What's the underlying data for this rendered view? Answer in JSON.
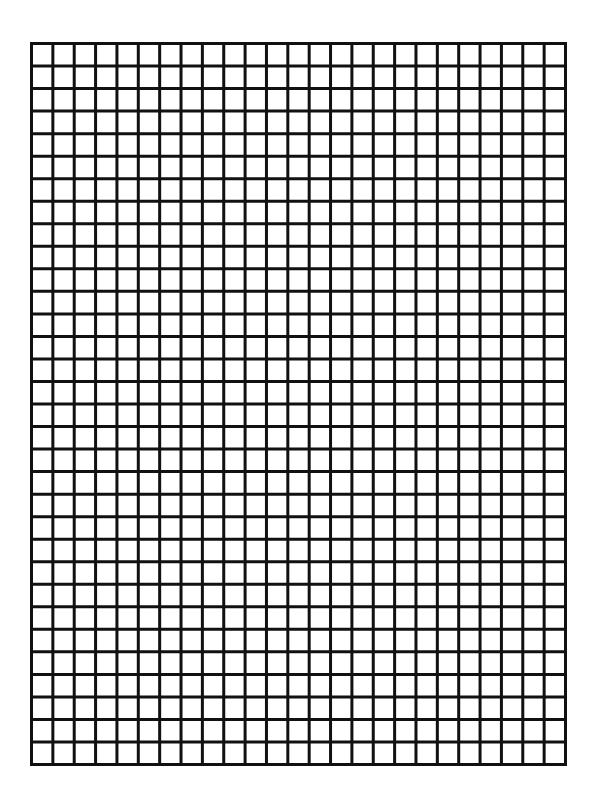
{
  "page": {
    "kind": "graph paper",
    "grid": {
      "columns": 25,
      "rows": 32,
      "line_color": "#111111",
      "background_color": "#ffffff"
    }
  }
}
